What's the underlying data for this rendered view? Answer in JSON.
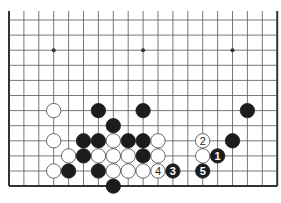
{
  "diagram": {
    "type": "go-board-fragment",
    "board_size": 19,
    "visible_rows": 12,
    "edges": {
      "left": true,
      "right": true,
      "bottom": true,
      "top": false
    },
    "geometry": {
      "x0": 9,
      "dx": 14.9,
      "y0": 20,
      "dy": 15.1,
      "top_line_start": 11
    },
    "colors": {
      "line": "#555555",
      "edge": "#333333",
      "black": "#1c1c1c",
      "white": "#ffffff",
      "white_stroke": "#444444",
      "label_on_black": "#ffffff",
      "label_on_white": "#222222"
    },
    "star_points": [
      {
        "col": 3,
        "row": 2
      },
      {
        "col": 9,
        "row": 2
      },
      {
        "col": 15,
        "row": 2
      }
    ],
    "stones": [
      {
        "col": 3,
        "row": 6,
        "color": "white",
        "label": ""
      },
      {
        "col": 6,
        "row": 6,
        "color": "black",
        "label": ""
      },
      {
        "col": 9,
        "row": 6,
        "color": "black",
        "label": ""
      },
      {
        "col": 16,
        "row": 6,
        "color": "black",
        "label": ""
      },
      {
        "col": 7,
        "row": 7,
        "color": "black",
        "label": ""
      },
      {
        "col": 3,
        "row": 8,
        "color": "white",
        "label": ""
      },
      {
        "col": 5,
        "row": 8,
        "color": "black",
        "label": ""
      },
      {
        "col": 6,
        "row": 8,
        "color": "black",
        "label": ""
      },
      {
        "col": 7,
        "row": 8,
        "color": "white",
        "label": ""
      },
      {
        "col": 8,
        "row": 8,
        "color": "black",
        "label": ""
      },
      {
        "col": 9,
        "row": 8,
        "color": "black",
        "label": ""
      },
      {
        "col": 10,
        "row": 8,
        "color": "white",
        "label": ""
      },
      {
        "col": 13,
        "row": 8,
        "color": "white",
        "label": "2"
      },
      {
        "col": 15,
        "row": 8,
        "color": "black",
        "label": ""
      },
      {
        "col": 4,
        "row": 9,
        "color": "white",
        "label": ""
      },
      {
        "col": 5,
        "row": 9,
        "color": "black",
        "label": ""
      },
      {
        "col": 6,
        "row": 9,
        "color": "white",
        "label": ""
      },
      {
        "col": 7,
        "row": 9,
        "color": "white",
        "label": ""
      },
      {
        "col": 8,
        "row": 9,
        "color": "white",
        "label": ""
      },
      {
        "col": 9,
        "row": 9,
        "color": "black",
        "label": ""
      },
      {
        "col": 10,
        "row": 9,
        "color": "white",
        "label": ""
      },
      {
        "col": 13,
        "row": 9,
        "color": "white",
        "label": ""
      },
      {
        "col": 14,
        "row": 9,
        "color": "black",
        "label": "1"
      },
      {
        "col": 3,
        "row": 10,
        "color": "white",
        "label": ""
      },
      {
        "col": 4,
        "row": 10,
        "color": "black",
        "label": ""
      },
      {
        "col": 6,
        "row": 10,
        "color": "black",
        "label": ""
      },
      {
        "col": 7,
        "row": 10,
        "color": "white",
        "label": ""
      },
      {
        "col": 8,
        "row": 10,
        "color": "white",
        "label": ""
      },
      {
        "col": 9,
        "row": 10,
        "color": "white",
        "label": ""
      },
      {
        "col": 10,
        "row": 10,
        "color": "white",
        "label": "4"
      },
      {
        "col": 11,
        "row": 10,
        "color": "black",
        "label": "3"
      },
      {
        "col": 13,
        "row": 10,
        "color": "black",
        "label": "5"
      },
      {
        "col": 7,
        "row": 11,
        "color": "black",
        "label": ""
      }
    ],
    "move_sequence": [
      "1",
      "2",
      "3",
      "4",
      "5"
    ]
  }
}
